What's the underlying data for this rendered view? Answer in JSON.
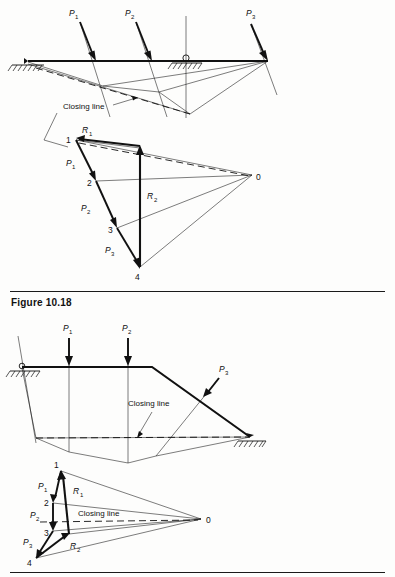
{
  "page": {
    "caption": "Figure 10.18",
    "background": "#fdfdfc",
    "ink": "#111111"
  },
  "figures": [
    {
      "id": "top",
      "name": "overhanging-beam-funicular",
      "type": "graphic-statics-construction",
      "space_diagram": {
        "beam_label": "beam",
        "supports": [
          {
            "name": "left-support",
            "kind": "pin-hatched",
            "x": 28,
            "y": 62
          },
          {
            "name": "mid-support",
            "kind": "roller-hatched",
            "x": 186,
            "y": 62
          }
        ],
        "loads": [
          {
            "label": "P",
            "sub": "1",
            "label_x": 72,
            "label_y": 16,
            "tail_x": 80,
            "tail_y": 22,
            "tip_x": 96,
            "tip_y": 60
          },
          {
            "label": "P",
            "sub": "2",
            "label_x": 128,
            "label_y": 16,
            "tail_x": 136,
            "tail_y": 22,
            "tip_x": 152,
            "tip_y": 60
          },
          {
            "label": "P",
            "sub": "3",
            "label_x": 249,
            "label_y": 16,
            "tail_x": 251,
            "tail_y": 24,
            "tip_x": 268,
            "tip_y": 60
          }
        ],
        "closing_line_label": "Closing line",
        "closing_line_label_x": 63,
        "closing_line_label_y": 109
      },
      "force_polygon": {
        "pole_label": "0",
        "pole_x": 252,
        "pole_y": 178,
        "points": [
          {
            "label": "1",
            "x": 76,
            "y": 138
          },
          {
            "label": "2",
            "x": 96,
            "y": 181
          },
          {
            "label": "3",
            "x": 117,
            "y": 228
          },
          {
            "label": "4",
            "x": 140,
            "y": 269
          }
        ],
        "segment_labels": [
          {
            "label": "P",
            "sub": "1",
            "x": 71,
            "y": 163
          },
          {
            "label": "P",
            "sub": "2",
            "x": 86,
            "y": 208
          },
          {
            "label": "P",
            "sub": "3",
            "x": 110,
            "y": 250
          }
        ],
        "reactions": [
          {
            "label": "R",
            "sub": "1",
            "x": 86,
            "y": 131
          },
          {
            "label": "R",
            "sub": "2",
            "x": 152,
            "y": 197
          }
        ]
      }
    },
    {
      "id": "bottom",
      "name": "inclined-member-funicular",
      "type": "graphic-statics-construction",
      "space_diagram": {
        "supports": [
          {
            "name": "left-support",
            "kind": "pin-hatched",
            "x": 22,
            "y": 368
          },
          {
            "name": "right-support",
            "kind": "pin-hatched",
            "x": 250,
            "y": 438
          }
        ],
        "loads": [
          {
            "label": "P",
            "sub": "1",
            "label_x": 66,
            "label_y": 330,
            "tail_x": 69,
            "tail_y": 338,
            "tip_x": 69,
            "tip_y": 365
          },
          {
            "label": "P",
            "sub": "2",
            "label_x": 126,
            "label_y": 330,
            "tail_x": 128,
            "tail_y": 338,
            "tip_x": 128,
            "tip_y": 365
          },
          {
            "label": "P",
            "sub": "3",
            "label_x": 223,
            "label_y": 371,
            "tail_x": 219,
            "tail_y": 378,
            "tip_x": 203,
            "tip_y": 397
          }
        ],
        "closing_line_label": "Closing line",
        "closing_line_label_x": 128,
        "closing_line_label_y": 406
      },
      "force_polygon": {
        "pole_label": "0",
        "pole_x": 201,
        "pole_y": 521,
        "closing_line_label": "Closing line",
        "closing_line_label_x": 98,
        "closing_line_label_y": 513,
        "points": [
          {
            "label": "1",
            "x": 61,
            "y": 470
          },
          {
            "label": "2",
            "x": 53,
            "y": 503
          },
          {
            "label": "3",
            "x": 53,
            "y": 531
          },
          {
            "label": "4",
            "x": 36,
            "y": 558
          }
        ],
        "segment_labels": [
          {
            "label": "P",
            "sub": "1",
            "x": 43,
            "y": 487
          },
          {
            "label": "P",
            "sub": "2",
            "x": 36,
            "y": 516
          },
          {
            "label": "P",
            "sub": "3",
            "x": 30,
            "y": 542
          }
        ],
        "reactions": [
          {
            "label": "R",
            "sub": "1",
            "x": 77,
            "y": 492
          },
          {
            "label": "R",
            "sub": "2",
            "x": 77,
            "y": 546
          }
        ]
      }
    }
  ]
}
